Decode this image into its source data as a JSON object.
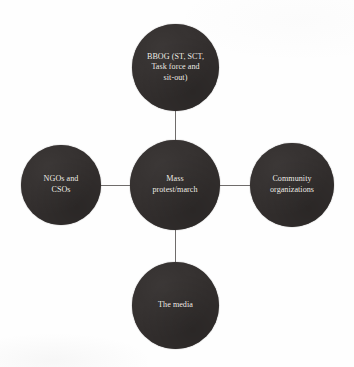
{
  "diagram": {
    "type": "hub-and-spoke",
    "background_color": "#fefefe",
    "node_fill_color": "#332f2e",
    "node_text_color": "#f2efe9",
    "connector_color": "#6f6c6b",
    "center_node": {
      "id": "mass-protest-march",
      "label": "Mass\nprotest/march"
    },
    "satellite_nodes": [
      {
        "id": "bbog",
        "position": "top",
        "label": "BBOG (ST, SCT,\nTask force and\nsit-out)"
      },
      {
        "id": "ngos-csos",
        "position": "left",
        "label": "NGOs and\nCSOs"
      },
      {
        "id": "community-organizations",
        "position": "right",
        "label": "Community\norganizations"
      },
      {
        "id": "the-media",
        "position": "bottom",
        "label": "The media"
      }
    ]
  }
}
